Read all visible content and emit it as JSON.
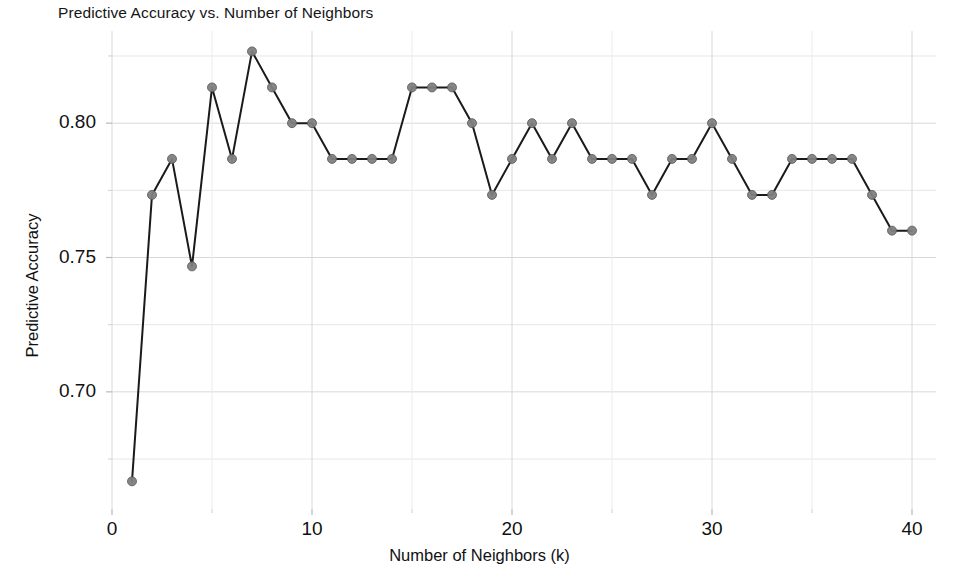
{
  "chart_data": {
    "type": "line",
    "title": "Predictive Accuracy vs. Number of Neighbors",
    "xlabel": "Number of Neighbors (k)",
    "ylabel": "Predictive Accuracy",
    "x": [
      1,
      2,
      3,
      4,
      5,
      6,
      7,
      8,
      9,
      10,
      11,
      12,
      13,
      14,
      15,
      16,
      17,
      18,
      19,
      20,
      21,
      22,
      23,
      24,
      25,
      26,
      27,
      28,
      29,
      30,
      31,
      32,
      33,
      34,
      35,
      36,
      37,
      38,
      39,
      40
    ],
    "values": [
      0.6667,
      0.7733,
      0.7867,
      0.7467,
      0.8133,
      0.7867,
      0.8267,
      0.8133,
      0.8,
      0.8,
      0.7867,
      0.7867,
      0.7867,
      0.7867,
      0.8133,
      0.8133,
      0.8133,
      0.8,
      0.7733,
      0.7867,
      0.8,
      0.7867,
      0.8,
      0.7867,
      0.7867,
      0.7867,
      0.7733,
      0.7867,
      0.7867,
      0.8,
      0.7867,
      0.7733,
      0.7733,
      0.7867,
      0.7867,
      0.7867,
      0.7867,
      0.7733,
      0.76,
      0.76
    ],
    "series": [
      {
        "name": "Predictive Accuracy",
        "values": [
          0.6667,
          0.7733,
          0.7867,
          0.7467,
          0.8133,
          0.7867,
          0.8267,
          0.8133,
          0.8,
          0.8,
          0.7867,
          0.7867,
          0.7867,
          0.7867,
          0.8133,
          0.8133,
          0.8133,
          0.8,
          0.7733,
          0.7867,
          0.8,
          0.7867,
          0.8,
          0.7867,
          0.7867,
          0.7867,
          0.7733,
          0.7867,
          0.7867,
          0.8,
          0.7867,
          0.7733,
          0.7733,
          0.7867,
          0.7867,
          0.7867,
          0.7867,
          0.7733,
          0.76,
          0.76
        ]
      }
    ],
    "xlim": [
      0,
      41.2
    ],
    "ylim": [
      0.6564,
      0.8343
    ],
    "xticks": [
      0,
      10,
      20,
      30,
      40
    ],
    "xtick_labels": [
      "0",
      "10",
      "20",
      "30",
      "40"
    ],
    "yticks": [
      0.7,
      0.75,
      0.8
    ],
    "ytick_labels": [
      "0.70",
      "0.75",
      "0.80"
    ],
    "y_minor_ticks": [
      0.675,
      0.725,
      0.775,
      0.825
    ],
    "x_minor_ticks": [
      5,
      15,
      25,
      35
    ],
    "grid": true,
    "legend": null,
    "marker": "circle",
    "marker_color": "#808080",
    "marker_edge_color": "#555555",
    "line_color": "#1a1a1a",
    "line_width": 2.0,
    "marker_size": 9,
    "grid_color": "#d8d8d8",
    "background": "#ffffff"
  }
}
